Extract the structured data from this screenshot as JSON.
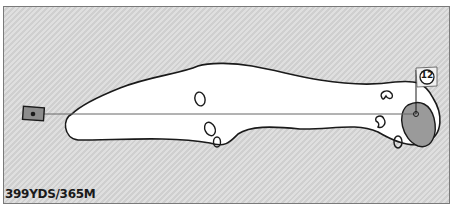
{
  "hole": {
    "number": "12",
    "yardage_label": "399YDS/365M"
  },
  "colors": {
    "background": "#d6d6d6",
    "fairway": "#ffffff",
    "green": "#9a9a9a",
    "outline": "#1a1a1a",
    "tee": "#8c8c8c"
  },
  "icons": {
    "tee": "tee-box",
    "flag": "pin-flag",
    "bunker": "sand-bunker"
  }
}
